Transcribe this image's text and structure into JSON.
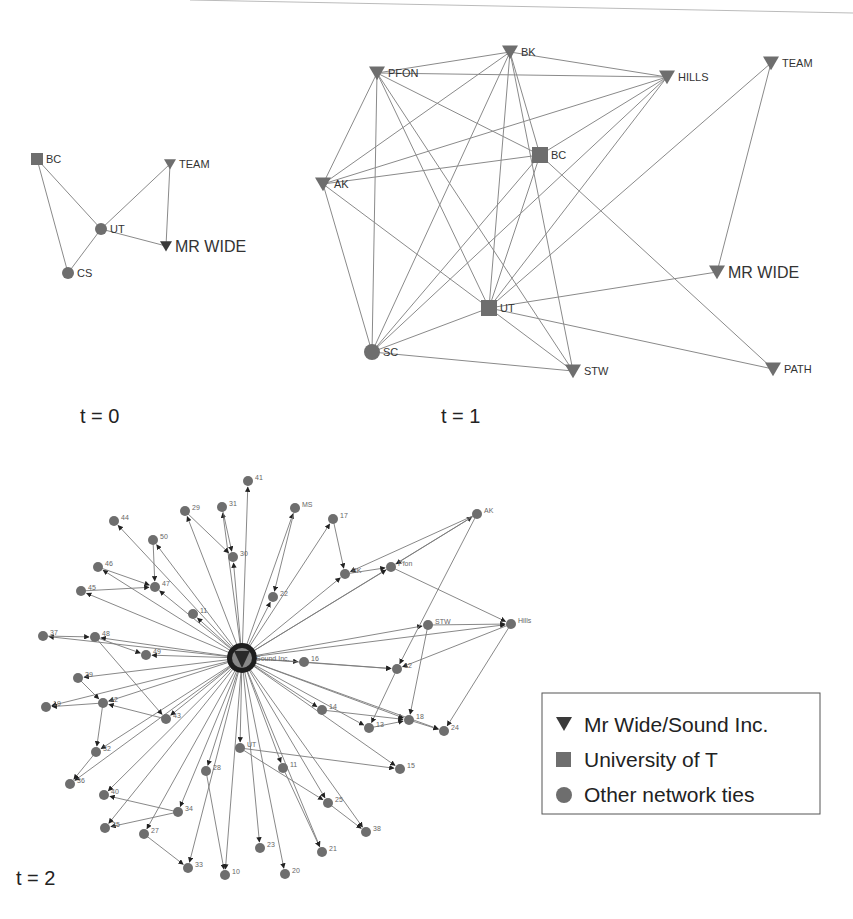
{
  "figure": {
    "panels": [
      {
        "label": "t = 0",
        "nodes": [
          {
            "id": "BC",
            "label": "BC",
            "shape": "square",
            "x": 37,
            "y": 159
          },
          {
            "id": "TEAM",
            "label": "TEAM",
            "shape": "triangle",
            "x": 170,
            "y": 164
          },
          {
            "id": "UT",
            "label": "UT",
            "shape": "circle",
            "x": 101,
            "y": 229
          },
          {
            "id": "MRWIDE",
            "label": "MR WIDE",
            "shape": "triangle-dark",
            "x": 166,
            "y": 246
          },
          {
            "id": "CS",
            "label": "CS",
            "shape": "circle",
            "x": 68,
            "y": 273
          }
        ],
        "edges": [
          [
            "BC",
            "UT"
          ],
          [
            "BC",
            "CS"
          ],
          [
            "UT",
            "CS"
          ],
          [
            "UT",
            "TEAM"
          ],
          [
            "UT",
            "MRWIDE"
          ],
          [
            "TEAM",
            "MRWIDE"
          ]
        ]
      },
      {
        "label": "t = 1",
        "nodes": [
          {
            "id": "PFON",
            "label": "PFON",
            "shape": "triangle",
            "x": 377,
            "y": 73
          },
          {
            "id": "BK",
            "label": "BK",
            "shape": "triangle",
            "x": 510,
            "y": 52
          },
          {
            "id": "HILLS",
            "label": "HILLS",
            "shape": "triangle",
            "x": 667,
            "y": 77
          },
          {
            "id": "TEAM",
            "label": "TEAM",
            "shape": "triangle",
            "x": 771,
            "y": 63
          },
          {
            "id": "BC",
            "label": "BC",
            "shape": "square",
            "x": 540,
            "y": 155
          },
          {
            "id": "AK",
            "label": "AK",
            "shape": "triangle",
            "x": 323,
            "y": 184
          },
          {
            "id": "UT",
            "label": "UT",
            "shape": "square",
            "x": 489,
            "y": 308
          },
          {
            "id": "MRWIDE",
            "label": "MR WIDE",
            "shape": "triangle",
            "x": 717,
            "y": 272
          },
          {
            "id": "SC",
            "label": "SC",
            "shape": "circle",
            "x": 372,
            "y": 352
          },
          {
            "id": "STW",
            "label": "STW",
            "shape": "triangle",
            "x": 573,
            "y": 371
          },
          {
            "id": "PATH",
            "label": "PATH",
            "shape": "triangle",
            "x": 773,
            "y": 369
          }
        ],
        "edges": [
          [
            "PFON",
            "BK"
          ],
          [
            "PFON",
            "HILLS"
          ],
          [
            "PFON",
            "AK"
          ],
          [
            "PFON",
            "SC"
          ],
          [
            "PFON",
            "UT"
          ],
          [
            "PFON",
            "BC"
          ],
          [
            "PFON",
            "STW"
          ],
          [
            "BK",
            "HILLS"
          ],
          [
            "BK",
            "AK"
          ],
          [
            "BK",
            "SC"
          ],
          [
            "BK",
            "UT"
          ],
          [
            "BK",
            "BC"
          ],
          [
            "BK",
            "STW"
          ],
          [
            "HILLS",
            "AK"
          ],
          [
            "HILLS",
            "SC"
          ],
          [
            "HILLS",
            "UT"
          ],
          [
            "HILLS",
            "BC"
          ],
          [
            "TEAM",
            "UT"
          ],
          [
            "TEAM",
            "MRWIDE"
          ],
          [
            "BC",
            "AK"
          ],
          [
            "BC",
            "SC"
          ],
          [
            "BC",
            "UT"
          ],
          [
            "BC",
            "PATH"
          ],
          [
            "AK",
            "SC"
          ],
          [
            "AK",
            "UT"
          ],
          [
            "UT",
            "SC"
          ],
          [
            "UT",
            "STW"
          ],
          [
            "UT",
            "MRWIDE"
          ],
          [
            "UT",
            "PATH"
          ],
          [
            "SC",
            "STW"
          ]
        ]
      },
      {
        "label": "t = 2",
        "hub": {
          "id": "SOUND",
          "label": "Sound Inc.",
          "x": 242,
          "y": 658
        },
        "nodes": [
          {
            "id": "41",
            "label": "41",
            "x": 248,
            "y": 481
          },
          {
            "id": "44",
            "label": "44",
            "x": 114,
            "y": 521
          },
          {
            "id": "29",
            "label": "29",
            "x": 185,
            "y": 511
          },
          {
            "id": "31",
            "label": "31",
            "x": 222,
            "y": 507
          },
          {
            "id": "MS",
            "label": "MS",
            "x": 295,
            "y": 508
          },
          {
            "id": "17",
            "label": "17",
            "x": 333,
            "y": 519
          },
          {
            "id": "AK",
            "label": "AK",
            "x": 477,
            "y": 514
          },
          {
            "id": "50",
            "label": "50",
            "x": 153,
            "y": 540
          },
          {
            "id": "30",
            "label": "30",
            "x": 233,
            "y": 557
          },
          {
            "id": "46",
            "label": "46",
            "x": 98,
            "y": 567
          },
          {
            "id": "47",
            "label": "47",
            "x": 155,
            "y": 587
          },
          {
            "id": "BK",
            "label": "BK",
            "x": 345,
            "y": 574
          },
          {
            "id": "PFON",
            "label": "Pfon",
            "x": 391,
            "y": 567
          },
          {
            "id": "45",
            "label": "45",
            "x": 81,
            "y": 591
          },
          {
            "id": "22",
            "label": "22",
            "x": 273,
            "y": 597
          },
          {
            "id": "11",
            "label": "11",
            "x": 193,
            "y": 614
          },
          {
            "id": "STW",
            "label": "STW",
            "x": 428,
            "y": 625
          },
          {
            "id": "HILLS",
            "label": "Hills",
            "x": 511,
            "y": 624
          },
          {
            "id": "37",
            "label": "37",
            "x": 43,
            "y": 636
          },
          {
            "id": "48",
            "label": "48",
            "x": 95,
            "y": 637
          },
          {
            "id": "49",
            "label": "49",
            "x": 146,
            "y": 655
          },
          {
            "id": "16",
            "label": "16",
            "x": 304,
            "y": 662
          },
          {
            "id": "12",
            "label": "12",
            "x": 397,
            "y": 669
          },
          {
            "id": "39",
            "label": "39",
            "x": 78,
            "y": 678
          },
          {
            "id": "14",
            "label": "14",
            "x": 322,
            "y": 710
          },
          {
            "id": "42",
            "label": "42",
            "x": 103,
            "y": 703
          },
          {
            "id": "19",
            "label": "19",
            "x": 46,
            "y": 707
          },
          {
            "id": "43",
            "label": "43",
            "x": 166,
            "y": 719
          },
          {
            "id": "13",
            "label": "13",
            "x": 369,
            "y": 728
          },
          {
            "id": "18",
            "label": "18",
            "x": 409,
            "y": 720
          },
          {
            "id": "24",
            "label": "24",
            "x": 444,
            "y": 731
          },
          {
            "id": "32",
            "label": "32",
            "x": 96,
            "y": 752
          },
          {
            "id": "UT",
            "label": "UT",
            "x": 240,
            "y": 748
          },
          {
            "id": "28",
            "label": "28",
            "x": 206,
            "y": 771
          },
          {
            "id": "11b",
            "label": "11",
            "x": 283,
            "y": 768
          },
          {
            "id": "15",
            "label": "15",
            "x": 400,
            "y": 769
          },
          {
            "id": "36",
            "label": "36",
            "x": 70,
            "y": 784
          },
          {
            "id": "40",
            "label": "40",
            "x": 104,
            "y": 795
          },
          {
            "id": "25",
            "label": "25",
            "x": 328,
            "y": 803
          },
          {
            "id": "34",
            "label": "34",
            "x": 178,
            "y": 812
          },
          {
            "id": "35",
            "label": "35",
            "x": 105,
            "y": 828
          },
          {
            "id": "27",
            "label": "27",
            "x": 144,
            "y": 834
          },
          {
            "id": "38",
            "label": "38",
            "x": 366,
            "y": 832
          },
          {
            "id": "23",
            "label": "23",
            "x": 260,
            "y": 848
          },
          {
            "id": "21",
            "label": "21",
            "x": 322,
            "y": 852
          },
          {
            "id": "33",
            "label": "33",
            "x": 188,
            "y": 868
          },
          {
            "id": "10",
            "label": "10",
            "x": 225,
            "y": 875
          },
          {
            "id": "20",
            "label": "20",
            "x": 285,
            "y": 874
          }
        ],
        "extra_edges": [
          [
            "46",
            "47"
          ],
          [
            "45",
            "47"
          ],
          [
            "50",
            "47"
          ],
          [
            "29",
            "30"
          ],
          [
            "31",
            "30"
          ],
          [
            "17",
            "BK"
          ],
          [
            "MS",
            "22"
          ],
          [
            "BK",
            "PFON"
          ],
          [
            "AK",
            "PFON"
          ],
          [
            "AK",
            "BK"
          ],
          [
            "AK",
            "12"
          ],
          [
            "PFON",
            "HILLS"
          ],
          [
            "STW",
            "HILLS"
          ],
          [
            "HILLS",
            "12"
          ],
          [
            "HILLS",
            "24"
          ],
          [
            "STW",
            "18"
          ],
          [
            "12",
            "13"
          ],
          [
            "18",
            "24"
          ],
          [
            "13",
            "18"
          ],
          [
            "48",
            "49"
          ],
          [
            "48",
            "43"
          ],
          [
            "42",
            "19"
          ],
          [
            "42",
            "32"
          ],
          [
            "37",
            "48"
          ],
          [
            "39",
            "42"
          ],
          [
            "43",
            "42"
          ],
          [
            "32",
            "36"
          ],
          [
            "34",
            "40"
          ],
          [
            "34",
            "35"
          ],
          [
            "27",
            "33"
          ],
          [
            "28",
            "10"
          ],
          [
            "11b",
            "21"
          ],
          [
            "25",
            "38"
          ],
          [
            "14",
            "18"
          ],
          [
            "16",
            "12"
          ],
          [
            "UT",
            "15"
          ],
          [
            "UT",
            "25"
          ]
        ]
      }
    ],
    "legend": {
      "items": [
        {
          "symbol": "triangle",
          "label": "Mr Wide/Sound Inc."
        },
        {
          "symbol": "square",
          "label": "University of T"
        },
        {
          "symbol": "circle",
          "label": "Other network ties"
        }
      ]
    },
    "colors": {
      "node": "#6e6e6e",
      "node_dark": "#3a3a3a",
      "edge": "#8a8a8a",
      "text": "#222222"
    }
  }
}
